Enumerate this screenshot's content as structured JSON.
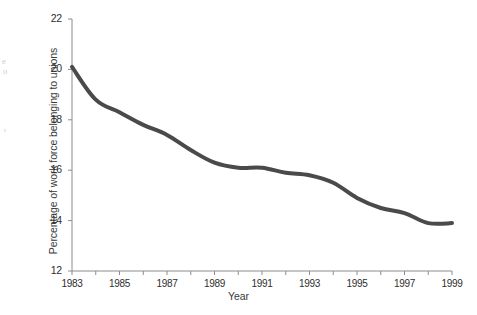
{
  "figure": {
    "background_color": "#ffffff",
    "axis_color": "#8c8c8c",
    "text_color": "#2e2e2e",
    "line_color": "#4a4a4a",
    "ghost_artifacts": [
      "e",
      "o",
      "r"
    ]
  },
  "chart_data": {
    "type": "line",
    "title": "",
    "xlabel": "Year",
    "ylabel": "Percentage of work force belonging to unions",
    "xlim": [
      1983,
      1999
    ],
    "ylim": [
      12,
      22
    ],
    "grid": false,
    "legend": "none",
    "line_color": "#4a4a4a",
    "line_width": 4,
    "y_ticks": [
      12,
      14,
      16,
      18,
      20,
      22
    ],
    "y_tick_labels": [
      "12",
      "14",
      "16",
      "18",
      "20",
      "22"
    ],
    "x_ticks": [
      1983,
      1984,
      1985,
      1986,
      1987,
      1988,
      1989,
      1990,
      1991,
      1992,
      1993,
      1994,
      1995,
      1996,
      1997,
      1998,
      1999
    ],
    "x_tick_labels": [
      "1983",
      "",
      "1985",
      "",
      "1987",
      "",
      "1989",
      "",
      "1991",
      "",
      "1993",
      "",
      "1995",
      "",
      "1997",
      "",
      "1999"
    ],
    "x_labeled_ticks": [
      "1983",
      "1985",
      "1987",
      "1989",
      "1991",
      "1993",
      "1995",
      "1997",
      "1999"
    ],
    "x": [
      1983,
      1984,
      1985,
      1986,
      1987,
      1988,
      1989,
      1990,
      1991,
      1992,
      1993,
      1994,
      1995,
      1996,
      1997,
      1998,
      1999
    ],
    "values": [
      20.1,
      18.8,
      18.3,
      17.8,
      17.4,
      16.8,
      16.3,
      16.1,
      16.1,
      15.9,
      15.8,
      15.5,
      14.9,
      14.5,
      14.3,
      13.9,
      13.9
    ],
    "series": [
      {
        "name": "Percentage of work force belonging to unions",
        "values": [
          20.1,
          18.8,
          18.3,
          17.8,
          17.4,
          16.8,
          16.3,
          16.1,
          16.1,
          15.9,
          15.8,
          15.5,
          14.9,
          14.5,
          14.3,
          13.9,
          13.9
        ]
      }
    ]
  }
}
